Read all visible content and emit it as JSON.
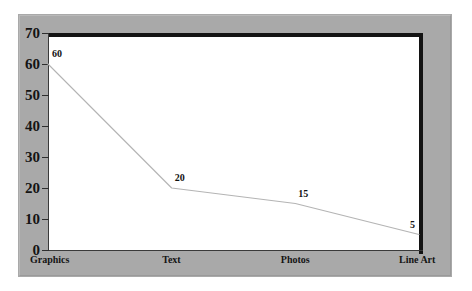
{
  "chart_data": {
    "type": "line",
    "title": "",
    "subtitle": "",
    "xlabel": "",
    "ylabel": "",
    "categories": [
      "Graphics",
      "Text",
      "Photos",
      "Line Art"
    ],
    "values": [
      60,
      20,
      15,
      5
    ],
    "point_labels": [
      "60",
      "20",
      "15",
      "5"
    ],
    "series": [
      {
        "name": "",
        "values": [
          60,
          20,
          15,
          5
        ]
      }
    ],
    "ylim": [
      0,
      70
    ],
    "ytick_values": [
      70,
      60,
      50,
      40,
      30,
      20,
      10,
      0
    ],
    "ytick_labels": [
      "70",
      "60",
      "50",
      "40",
      "30",
      "20",
      "10",
      "0"
    ],
    "grid": false,
    "legend": false,
    "legend_position": "none",
    "annotations": []
  },
  "style": {
    "frame_color": "#a9a9a9",
    "plot_background": "#ffffff",
    "page_background": "#ffffff",
    "axis_color": "#3a3a3a",
    "rule_color": "#131313",
    "series_color": "#b4b4b4",
    "text_color": "#141414"
  }
}
